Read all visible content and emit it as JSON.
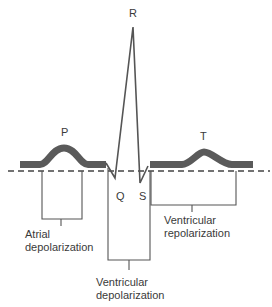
{
  "diagram": {
    "colors": {
      "line": "#555555",
      "band": "#5a5a5a",
      "text": "#3a3a3a",
      "background": "#ffffff"
    },
    "wave_labels": {
      "p": "P",
      "q": "Q",
      "r": "R",
      "s": "S",
      "t": "T"
    },
    "brackets": {
      "atrial": {
        "line1": "Atrial",
        "line2": "depolarization"
      },
      "ventricular_depol": {
        "line1": "Ventricular",
        "line2": "depolarization"
      },
      "ventricular_repol": {
        "line1": "Ventricular",
        "line2": "repolarization"
      }
    }
  }
}
